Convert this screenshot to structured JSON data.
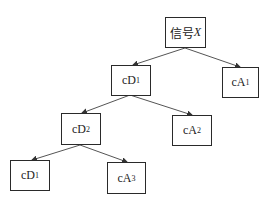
{
  "diagram": {
    "type": "tree",
    "colors": {
      "line": "#555555",
      "border": "#2a2a2a",
      "text": "#222222"
    },
    "nodes": {
      "root": {
        "prefix": "信号",
        "var": "X"
      },
      "cD1": {
        "base": "cD",
        "sub": "1"
      },
      "cA1": {
        "base": "cA",
        "sub": "1"
      },
      "cD2": {
        "base": "cD",
        "sub": "2"
      },
      "cA2": {
        "base": "cA",
        "sub": "2"
      },
      "cD3": {
        "base": "cD",
        "sub": "1"
      },
      "cA3": {
        "base": "cA",
        "sub": "3"
      }
    },
    "edges": [
      [
        "root",
        "cD1"
      ],
      [
        "root",
        "cA1"
      ],
      [
        "cD1",
        "cD2"
      ],
      [
        "cD1",
        "cA2"
      ],
      [
        "cD2",
        "cD3"
      ],
      [
        "cD2",
        "cA3"
      ]
    ]
  }
}
